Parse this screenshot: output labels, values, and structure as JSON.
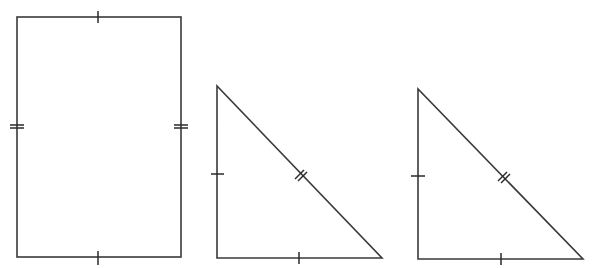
{
  "diagram": {
    "stroke_color": "#3a3a3a",
    "background": "#ffffff",
    "shapes": [
      {
        "id": "rectangle",
        "type": "rectangle",
        "x": 17,
        "y": 17,
        "width": 164,
        "height": 240,
        "marks": {
          "top": "single-tick",
          "bottom": "single-tick",
          "left": "double-tick",
          "right": "double-tick"
        }
      },
      {
        "id": "triangle-1",
        "type": "right-triangle",
        "points": [
          [
            217,
            86
          ],
          [
            217,
            258
          ],
          [
            382,
            258
          ]
        ],
        "marks": {
          "vertical-leg": "single-tick",
          "horizontal-leg": "single-tick",
          "hypotenuse": "double-tick"
        }
      },
      {
        "id": "triangle-2",
        "type": "right-triangle",
        "points": [
          [
            418,
            89
          ],
          [
            418,
            259
          ],
          [
            583,
            259
          ]
        ],
        "marks": {
          "vertical-leg": "single-tick",
          "horizontal-leg": "single-tick",
          "hypotenuse": "double-tick"
        }
      }
    ]
  }
}
